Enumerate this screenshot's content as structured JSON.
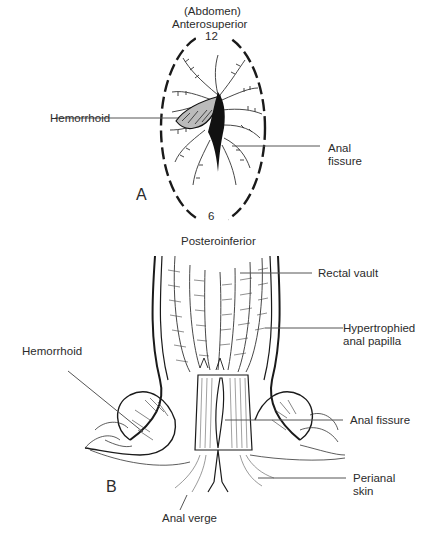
{
  "figure": {
    "panel_a": {
      "letter": "A",
      "top_label_1": "(Abdomen)",
      "top_label_2": "Anterosuperior",
      "clock_top": "12",
      "clock_bottom": "6",
      "bottom_label": "Posteroinferior",
      "callouts": {
        "hemorrhoid": "Hemorrhoid",
        "anal_fissure_1": "Anal",
        "anal_fissure_2": "fissure"
      }
    },
    "panel_b": {
      "letter": "B",
      "callouts": {
        "rectal_vault": "Rectal vault",
        "papilla_1": "Hypertrophied",
        "papilla_2": "anal papilla",
        "hemorrhoid": "Hemorrhoid",
        "anal_fissure": "Anal fissure",
        "perianal_1": "Perianal",
        "perianal_2": "skin",
        "anal_verge": "Anal verge"
      }
    },
    "colors": {
      "ink": "#1a1a1a",
      "leader": "#555555"
    }
  }
}
